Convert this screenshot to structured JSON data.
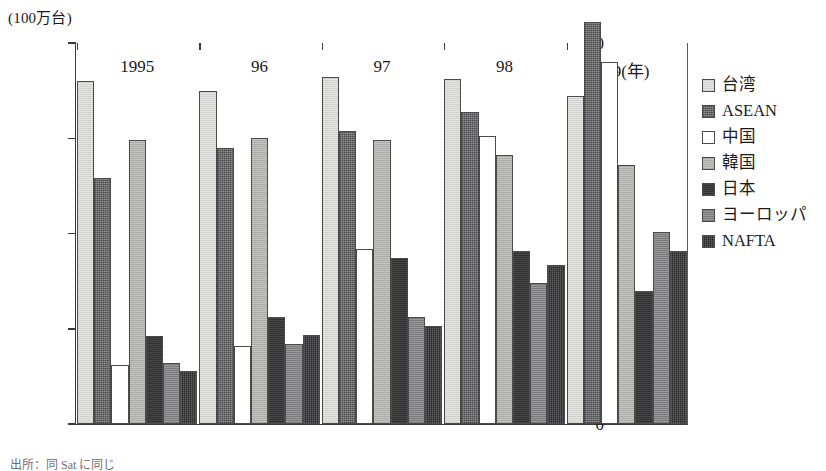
{
  "chart_data": {
    "type": "bar",
    "title": "",
    "subtitle": "",
    "xlabel": "",
    "ylabel": "(100万台)",
    "y_unit_caption": "(100万台)",
    "categories": [
      "1995",
      "96",
      "97",
      "98",
      "99(年)"
    ],
    "x_tick_labels": [
      "1995",
      "96",
      "97",
      "98",
      "99(年)"
    ],
    "y_tick_labels": [
      "20",
      "15",
      "10",
      "5",
      "0"
    ],
    "y_tick_values": [
      20,
      15,
      10,
      5,
      0
    ],
    "ylim": [
      0,
      20.5
    ],
    "grid": false,
    "legend_position": "right",
    "series": [
      {
        "name": "台湾",
        "key": "taiwan",
        "color": "#e6e6e2",
        "values": [
          18.0,
          17.5,
          18.2,
          18.1,
          17.2
        ]
      },
      {
        "name": "ASEAN",
        "key": "asean",
        "color": "#77767a",
        "values": [
          12.9,
          14.5,
          15.4,
          16.4,
          21.1
        ]
      },
      {
        "name": "中国",
        "key": "china",
        "color": "#ffffff",
        "values": [
          3.1,
          4.1,
          9.2,
          15.1,
          19.0
        ]
      },
      {
        "name": "韓国",
        "key": "korea",
        "color": "#bcbcb8",
        "values": [
          14.9,
          15.0,
          14.9,
          14.1,
          13.6
        ]
      },
      {
        "name": "日本",
        "key": "japan",
        "color": "#3a3a3c",
        "values": [
          4.6,
          5.6,
          8.7,
          9.1,
          7.0
        ]
      },
      {
        "name": "ヨーロッパ",
        "key": "europe",
        "color": "#8e8e90",
        "values": [
          3.2,
          4.2,
          5.6,
          7.4,
          10.1
        ]
      },
      {
        "name": "NAFTA",
        "key": "nafta",
        "color": "#424244",
        "values": [
          2.8,
          4.65,
          5.15,
          8.35,
          9.1
        ]
      }
    ]
  },
  "legend": {
    "items": [
      {
        "label": "台湾",
        "key": "taiwan"
      },
      {
        "label": "ASEAN",
        "key": "asean"
      },
      {
        "label": "中国",
        "key": "china"
      },
      {
        "label": "韓国",
        "key": "korea"
      },
      {
        "label": "日本",
        "key": "japan"
      },
      {
        "label": "ヨーロッパ",
        "key": "europe"
      },
      {
        "label": "NAFTA",
        "key": "nafta"
      }
    ]
  },
  "source_note": "出所：同 Sat に同じ"
}
